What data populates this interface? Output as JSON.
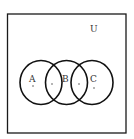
{
  "diagram": {
    "type": "venn",
    "universe_label": "U",
    "sets": [
      {
        "label": "A"
      },
      {
        "label": "B"
      },
      {
        "label": "C"
      }
    ],
    "stroke_color": "#111111",
    "background": "#ffffff"
  }
}
